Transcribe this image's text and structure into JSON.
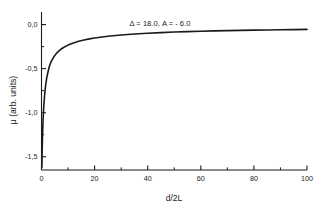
{
  "chart_data": {
    "type": "line",
    "title": "",
    "annotation": "Δ = 18.0,  A = - 6.0",
    "xlabel": "d/2L",
    "ylabel": "μ (arb. units)",
    "xlim": [
      0,
      100
    ],
    "ylim": [
      -1.65,
      0.12
    ],
    "grid": false,
    "legend": null,
    "xticks": [
      0,
      20,
      40,
      60,
      80,
      100
    ],
    "xtick_labels": [
      "0",
      "20",
      "40",
      "60",
      "80",
      "100"
    ],
    "xminor_ticks": [
      10,
      30,
      50,
      70,
      90
    ],
    "yticks": [
      0.0,
      -0.5,
      -1.0,
      -1.5
    ],
    "ytick_labels": [
      "0,0",
      "-0,5",
      "-1,0",
      "-1,5"
    ],
    "yminor_ticks": [
      -0.25,
      -0.75,
      -1.25
    ],
    "line_color": "#1a1a1a",
    "line_width": 1.6,
    "series": [
      {
        "name": "mu",
        "x": [
          0.15,
          0.2,
          0.25,
          0.3,
          0.4,
          0.5,
          0.6,
          0.7,
          0.8,
          0.9,
          1.0,
          1.2,
          1.4,
          1.6,
          1.8,
          2.0,
          2.5,
          3.0,
          3.5,
          4.0,
          4.5,
          5.0,
          6.0,
          7.0,
          8.0,
          9.0,
          10.0,
          12.0,
          14.0,
          16.0,
          18.0,
          20.0,
          25.0,
          30.0,
          35.0,
          40.0,
          45.0,
          50.0,
          55.0,
          60.0,
          65.0,
          70.0,
          75.0,
          80.0,
          85.0,
          90.0,
          95.0,
          100.0
        ],
        "y": [
          -1.62,
          -1.52,
          -1.44,
          -1.37,
          -1.25,
          -1.16,
          -1.08,
          -1.02,
          -0.96,
          -0.91,
          -0.87,
          -0.79,
          -0.73,
          -0.68,
          -0.64,
          -0.6,
          -0.53,
          -0.47,
          -0.43,
          -0.4,
          -0.375,
          -0.35,
          -0.315,
          -0.288,
          -0.266,
          -0.248,
          -0.233,
          -0.208,
          -0.189,
          -0.174,
          -0.162,
          -0.152,
          -0.132,
          -0.118,
          -0.107,
          -0.098,
          -0.091,
          -0.085,
          -0.08,
          -0.076,
          -0.072,
          -0.069,
          -0.066,
          -0.063,
          -0.061,
          -0.059,
          -0.057,
          -0.055
        ]
      }
    ]
  },
  "figure": {
    "background_color": "#ffffff",
    "axis_color": "#1a1a1a",
    "text_color": "#1a1a1a"
  }
}
